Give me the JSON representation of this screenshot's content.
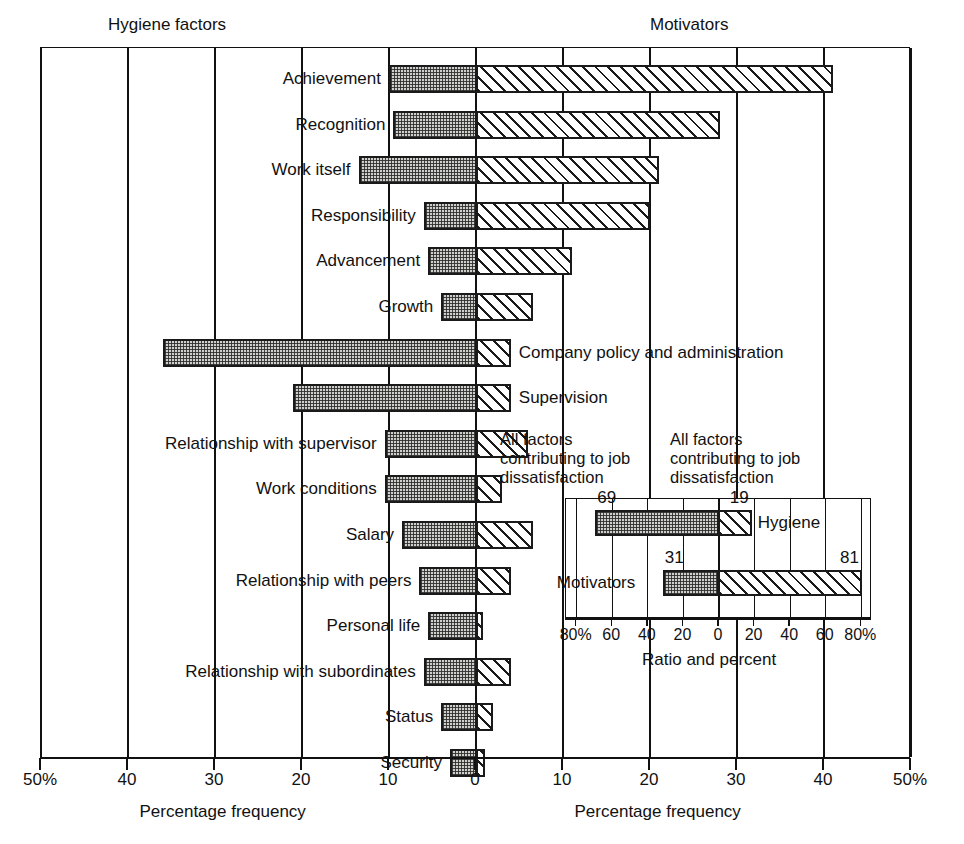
{
  "headers": {
    "left": "Hygiene factors",
    "right": "Motivators"
  },
  "axis": {
    "left_label": "Percentage frequency",
    "right_label": "Percentage frequency",
    "ticks": [
      "50%",
      "40",
      "30",
      "20",
      "10",
      "0",
      "10",
      "20",
      "30",
      "40",
      "50%"
    ],
    "tick_values": [
      -50,
      -40,
      -30,
      -20,
      -10,
      0,
      10,
      20,
      30,
      40,
      50
    ]
  },
  "inset": {
    "head_left": "All factors contributing to job dissatisfaction",
    "head_right": "All factors contributing to job dissatisfaction",
    "axis_label": "Ratio and percent",
    "ticks": [
      "80%",
      "60",
      "40",
      "20",
      "0",
      "20",
      "40",
      "60",
      "80%"
    ],
    "tick_values": [
      -80,
      -60,
      -40,
      -20,
      0,
      20,
      40,
      60,
      80
    ],
    "rows": [
      {
        "name": "Hygiene",
        "hygiene": 69,
        "motivator": 19,
        "label_hygiene": "69",
        "label_motivator": "19",
        "name_side": "right"
      },
      {
        "name": "Motivators",
        "hygiene": 31,
        "motivator": 81,
        "label_hygiene": "31",
        "label_motivator": "81",
        "name_side": "left"
      }
    ]
  },
  "chart_data": {
    "type": "bar",
    "title": "",
    "subtitle": "",
    "xlabel": "Percentage frequency",
    "ylabel": "",
    "xlim": [
      -50,
      50
    ],
    "grid": true,
    "orientation": "horizontal",
    "diverging": true,
    "legend": [
      "Hygiene factors",
      "Motivators"
    ],
    "categories": [
      "Achievement",
      "Recognition",
      "Work itself",
      "Responsibility",
      "Advancement",
      "Growth",
      "Company policy and administration",
      "Supervision",
      "Relationship with supervisor",
      "Work conditions",
      "Salary",
      "Relationship with peers",
      "Personal life",
      "Relationship with subordinates",
      "Status",
      "Security"
    ],
    "label_side": [
      "left",
      "left",
      "left",
      "left",
      "left",
      "left",
      "right",
      "right",
      "left",
      "left",
      "left",
      "left",
      "left",
      "left",
      "left",
      "left"
    ],
    "series": [
      {
        "name": "Hygiene factors",
        "values": [
          10,
          9.5,
          13.5,
          6,
          5.5,
          4,
          36,
          21,
          10.5,
          10.5,
          8.5,
          6.5,
          5.5,
          6,
          4,
          3
        ]
      },
      {
        "name": "Motivators",
        "values": [
          41,
          28,
          21,
          20,
          11,
          6.5,
          4,
          4,
          6,
          3,
          6.5,
          4,
          0.8,
          4,
          2,
          1
        ]
      }
    ]
  }
}
